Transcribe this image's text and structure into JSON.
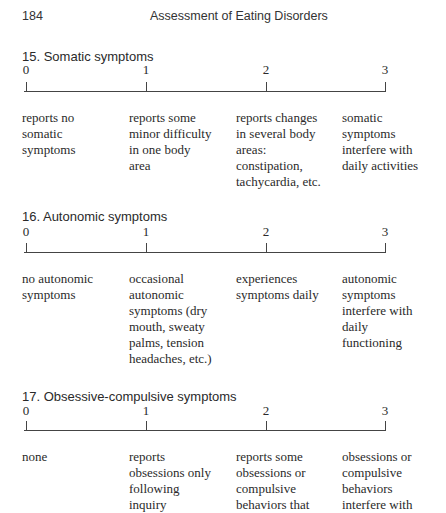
{
  "header": {
    "page_number": "184",
    "running_title": "Assessment of Eating Disorders"
  },
  "items": [
    {
      "title": "15.  Somatic symptoms",
      "scale": [
        "0",
        "1",
        "2",
        "3"
      ],
      "descriptions": [
        [
          "reports no",
          "somatic",
          "symptoms"
        ],
        [
          "reports some",
          "minor difficulty",
          "in one body",
          "area"
        ],
        [
          "reports changes",
          "in several body",
          "areas:",
          "constipation,",
          "tachycardia, etc."
        ],
        [
          "somatic",
          "symptoms",
          "interfere with",
          "daily activities"
        ]
      ]
    },
    {
      "title": "16.  Autonomic symptoms",
      "scale": [
        "0",
        "1",
        "2",
        "3"
      ],
      "descriptions": [
        [
          "no autonomic",
          "symptoms"
        ],
        [
          "occasional",
          "autonomic",
          "symptoms (dry",
          "mouth, sweaty",
          "palms, tension",
          "headaches, etc.)"
        ],
        [
          "experiences",
          "symptoms daily"
        ],
        [
          "autonomic",
          "symptoms",
          "interfere with",
          "daily",
          "functioning"
        ]
      ]
    },
    {
      "title": "17.  Obsessive-compulsive symptoms",
      "scale": [
        "0",
        "1",
        "2",
        "3"
      ],
      "descriptions": [
        [
          "none"
        ],
        [
          "reports",
          "obsessions only",
          "following",
          "inquiry"
        ],
        [
          "reports some",
          "obsessions or",
          "compulsive",
          "behaviors that"
        ],
        [
          "obsessions or",
          "compulsive",
          "behaviors",
          "interfere with"
        ]
      ]
    }
  ]
}
